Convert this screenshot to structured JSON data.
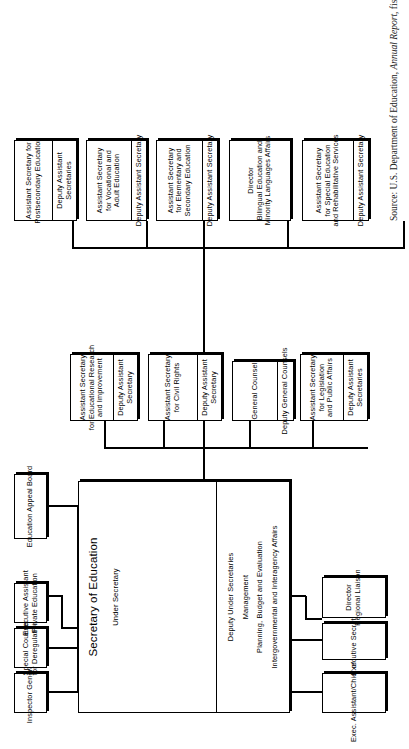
{
  "document": {
    "title": "U.S. Department of Education Organization Chart",
    "source_prefix": "Source: U.S. Department of Education, ",
    "source_italic": "Annual Report",
    "source_suffix": ", fiscal year, 1984."
  },
  "colors": {
    "ink": "#000000",
    "paper": "#ffffff"
  },
  "secretary": {
    "title": "Secretary of Education",
    "under_secretary": "Under Secretary",
    "deputy_block": [
      "Deputy Under Secretaries",
      "Management",
      "Planning, Budget and Evaluation",
      "Intergovernmental and Interagency Affairs"
    ]
  },
  "staff_top": [
    {
      "name": "inspector-general",
      "lines": [
        "Inspector General"
      ]
    },
    {
      "name": "special-counsel",
      "lines": [
        "Special Counsel",
        "for Deregulation"
      ]
    },
    {
      "name": "executive-assistant",
      "lines": [
        "Executive Assistant",
        "Private Education"
      ]
    },
    {
      "name": "education-appeal-board",
      "lines": [
        "Education Appeal Board"
      ]
    }
  ],
  "staff_bottom": [
    {
      "name": "exec-assistant-chief-of-staff",
      "lines": [
        "Exec. Assistant/Chief of Staff"
      ]
    },
    {
      "name": "executive-secretary",
      "lines": [
        "Executive Secretary"
      ]
    },
    {
      "name": "director-regional-liaison",
      "lines": [
        "Director",
        "Regional Liaison"
      ]
    }
  ],
  "middle_column": [
    {
      "name": "educational-research-improvement",
      "lines": [
        "Assistant Secretary",
        "for Educational Research",
        "and Improvement"
      ],
      "sub": [
        "Deputy Assistant",
        "Secretary"
      ]
    },
    {
      "name": "civil-rights",
      "lines": [
        "Assistant Secretary",
        "for Civil Rights"
      ],
      "sub": [
        "Deputy Assistant",
        "Secretary"
      ]
    },
    {
      "name": "general-counsel",
      "lines": [
        "General Counsel"
      ],
      "sub": [
        "Deputy General Counsels"
      ]
    },
    {
      "name": "legislation-public-affairs",
      "lines": [
        "Assistant Secretary",
        "for Legislation",
        "and Public Affairs"
      ],
      "sub": [
        "Deputy Assistant",
        "Secretaries"
      ]
    }
  ],
  "right_column": [
    {
      "name": "postsecondary-education",
      "lines": [
        "Assistant Secretary for",
        "Postsecondary Education"
      ],
      "sub": [
        "Deputy Assistant",
        "Secretaries"
      ]
    },
    {
      "name": "vocational-adult-education",
      "lines": [
        "Assistant Secretary",
        "for Vocational and",
        "Adult Education"
      ],
      "sub": [
        "Deputy Assistant Secretary"
      ]
    },
    {
      "name": "elementary-secondary-education",
      "lines": [
        "Assistant Secretary",
        "for Elementary and",
        "Secondary Education"
      ],
      "sub": [
        "Deputy Assistant Secretary"
      ]
    },
    {
      "name": "bilingual-education",
      "lines": [
        "Director",
        "Bilingual Education and",
        "Minority Languages Affairs"
      ],
      "sub": []
    },
    {
      "name": "special-education-rehabilitative-services",
      "lines": [
        "Assistant Secretary",
        "for Special Education",
        "and Rehabilitative Services"
      ],
      "sub": [
        "Deputy Assistant Secretary"
      ]
    }
  ]
}
